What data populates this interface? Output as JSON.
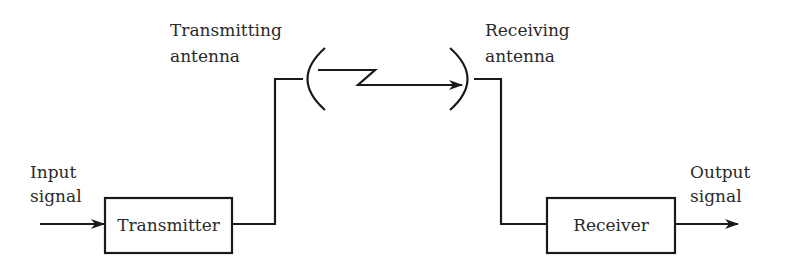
{
  "diagram": {
    "type": "block-diagram",
    "labels": {
      "input": [
        "Input",
        "signal"
      ],
      "transmitting_antenna": [
        "Transmitting",
        "antenna"
      ],
      "receiving_antenna": [
        "Receiving",
        "antenna"
      ],
      "output": [
        "Output",
        "signal"
      ]
    },
    "blocks": [
      {
        "id": "transmitter",
        "label": "Transmitter"
      },
      {
        "id": "receiver",
        "label": "Receiver"
      }
    ],
    "connections": [
      {
        "from": "input",
        "to": "transmitter",
        "style": "arrow"
      },
      {
        "from": "transmitter",
        "to": "transmitting_antenna",
        "style": "wire"
      },
      {
        "from": "transmitting_antenna",
        "to": "receiving_antenna",
        "style": "zigzag-arrow"
      },
      {
        "from": "receiving_antenna",
        "to": "receiver",
        "style": "wire"
      },
      {
        "from": "receiver",
        "to": "output",
        "style": "arrow"
      }
    ],
    "colors": {
      "line": "#1a1a1a",
      "text": "#2a2a2a",
      "background": "#ffffff"
    }
  }
}
